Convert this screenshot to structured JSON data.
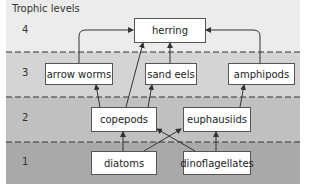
{
  "title": "Trophic levels",
  "colors": {
    "level4": "#ececec",
    "level3": "#d4d4d4",
    "level2": "#c0c0c0",
    "level1": "#a9a9a9",
    "box_fill": "#ffffff",
    "line": "#333333"
  },
  "levels": [
    {
      "number": "4",
      "label": "4"
    },
    {
      "number": "3",
      "label": "3"
    },
    {
      "number": "2",
      "label": "2"
    },
    {
      "number": "1",
      "label": "1"
    }
  ],
  "nodes": {
    "herring": {
      "label": "herring",
      "level": 4
    },
    "arrow_worms": {
      "label": "arrow worms",
      "level": 3
    },
    "sand_eels": {
      "label": "sand eels",
      "level": 3
    },
    "amphipods": {
      "label": "amphipods",
      "level": 3
    },
    "copepods": {
      "label": "copepods",
      "level": 2
    },
    "euphausiids": {
      "label": "euphausiids",
      "level": 2
    },
    "diatoms": {
      "label": "diatoms",
      "level": 1
    },
    "dinoflagellates": {
      "label": "dinoflagellates",
      "level": 1
    }
  },
  "edges": [
    {
      "from": "arrow_worms",
      "to": "herring"
    },
    {
      "from": "sand_eels",
      "to": "herring"
    },
    {
      "from": "amphipods",
      "to": "herring"
    },
    {
      "from": "copepods",
      "to": "herring"
    },
    {
      "from": "copepods",
      "to": "arrow_worms"
    },
    {
      "from": "copepods",
      "to": "sand_eels"
    },
    {
      "from": "euphausiids",
      "to": "amphipods"
    },
    {
      "from": "diatoms",
      "to": "copepods"
    },
    {
      "from": "diatoms",
      "to": "euphausiids"
    },
    {
      "from": "dinoflagellates",
      "to": "copepods"
    },
    {
      "from": "dinoflagellates",
      "to": "euphausiids"
    }
  ]
}
